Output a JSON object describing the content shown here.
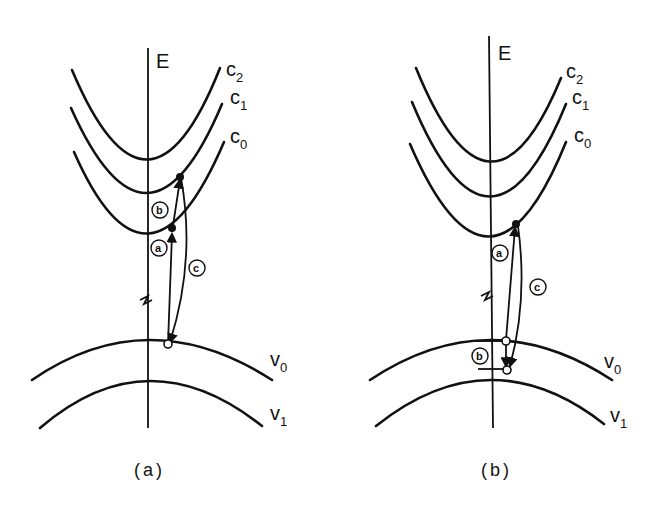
{
  "panels": [
    {
      "id": "a",
      "caption": "(a)",
      "axis_label": "E",
      "conduction_bands": [
        {
          "label": "c",
          "sub": "2"
        },
        {
          "label": "c",
          "sub": "1"
        },
        {
          "label": "c",
          "sub": "0"
        }
      ],
      "valence_bands": [
        {
          "label": "v",
          "sub": "0"
        },
        {
          "label": "v",
          "sub": "1"
        }
      ],
      "transitions": [
        "a",
        "b",
        "c"
      ]
    },
    {
      "id": "b",
      "caption": "(b)",
      "axis_label": "E",
      "conduction_bands": [
        {
          "label": "c",
          "sub": "2"
        },
        {
          "label": "c",
          "sub": "1"
        },
        {
          "label": "c",
          "sub": "0"
        }
      ],
      "valence_bands": [
        {
          "label": "v",
          "sub": "0"
        },
        {
          "label": "v",
          "sub": "1"
        }
      ],
      "transitions": [
        "a",
        "b",
        "c"
      ]
    }
  ],
  "colors": {
    "ink": "#111111",
    "background": "#ffffff"
  }
}
